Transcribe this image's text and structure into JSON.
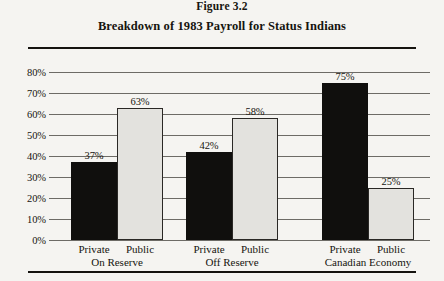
{
  "figure": {
    "label": "Figure 3.2",
    "title": "Breakdown of 1983 Payroll for Status Indians"
  },
  "chart_data": {
    "type": "bar",
    "title": "Breakdown of 1983 Payroll for Status Indians",
    "xlabel": "",
    "ylabel": "",
    "ylim": [
      0,
      80
    ],
    "ytick_labels": [
      "0%",
      "10%",
      "20%",
      "30%",
      "40%",
      "50%",
      "60%",
      "70%",
      "80%"
    ],
    "ytick_values": [
      0,
      10,
      20,
      30,
      40,
      50,
      60,
      70,
      80
    ],
    "grid": true,
    "legend": "none",
    "categories": [
      "On Reserve",
      "Off Reserve",
      "Canadian Economy"
    ],
    "series": [
      {
        "name": "Private",
        "values": [
          37,
          42,
          75
        ],
        "color": "#100f0d"
      },
      {
        "name": "Public",
        "values": [
          63,
          58,
          25
        ],
        "color": "#e3e2de"
      }
    ],
    "bars": [
      {
        "group": "On Reserve",
        "series": "Private",
        "value": 37,
        "label": "37%"
      },
      {
        "group": "On Reserve",
        "series": "Public",
        "value": 63,
        "label": "63%"
      },
      {
        "group": "Off Reserve",
        "series": "Private",
        "value": 42,
        "label": "42%"
      },
      {
        "group": "Off Reserve",
        "series": "Public",
        "value": 58,
        "label": "58%"
      },
      {
        "group": "Canadian Economy",
        "series": "Private",
        "value": 75,
        "label": "75%"
      },
      {
        "group": "Canadian Economy",
        "series": "Public",
        "value": 25,
        "label": "25%"
      }
    ],
    "group_labels": [
      {
        "series_left": "Private",
        "series_right": "Public",
        "group": "On Reserve"
      },
      {
        "series_left": "Private",
        "series_right": "Public",
        "group": "Off Reserve"
      },
      {
        "series_left": "Private",
        "series_right": "Public",
        "group": "Canadian Economy"
      }
    ]
  }
}
